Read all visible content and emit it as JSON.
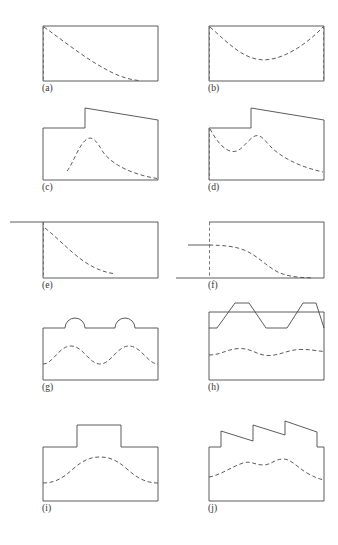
{
  "figure": {
    "panel_count": 10,
    "colors": {
      "outline": "#4a4a4a",
      "dashed": "#4a4a4a",
      "dashed_edge": "#6a6a6a",
      "background": "#ffffff",
      "label": "#333333"
    },
    "panels": [
      {
        "id": "a",
        "label": "(a)",
        "outline_name": "plain-rectangle",
        "interior_curve": "monotonic-decay",
        "left_edge_dashed": true,
        "right_edge_dashed": false
      },
      {
        "id": "b",
        "label": "(b)",
        "outline_name": "plain-rectangle",
        "interior_curve": "u-shaped-catenary",
        "left_edge_dashed": true,
        "right_edge_dashed": true
      },
      {
        "id": "c",
        "label": "(c)",
        "outline_name": "single-raised-step-sloping-roof",
        "interior_curve": "peak-and-decay",
        "left_edge_dashed": false,
        "right_edge_dashed": false
      },
      {
        "id": "d",
        "label": "(d)",
        "outline_name": "single-raised-step-sloping-roof",
        "interior_curve": "dip-peak-decay",
        "left_edge_dashed": true,
        "right_edge_dashed": false
      },
      {
        "id": "e",
        "label": "(e)",
        "outline_name": "rectangle-with-left-extended-top-line",
        "interior_curve": "monotonic-decay-partial",
        "left_edge_dashed": true,
        "right_edge_dashed": false
      },
      {
        "id": "f",
        "label": "(f)",
        "outline_name": "rectangle-with-left-extended-base-and-mid-line",
        "interior_curve": "sigmoid-descent",
        "left_edge_dashed": true,
        "right_edge_dashed": false
      },
      {
        "id": "g",
        "label": "(g)",
        "outline_name": "rectangle-with-two-semicircular-bumps",
        "interior_curve": "two-hump-sinusoid",
        "left_edge_dashed": false,
        "right_edge_dashed": false
      },
      {
        "id": "h",
        "label": "(h)",
        "outline_name": "rectangle-with-two-trapezoidal-crenellations",
        "interior_curve": "gentle-wave",
        "left_edge_dashed": false,
        "right_edge_dashed": false
      },
      {
        "id": "i",
        "label": "(i)",
        "outline_name": "rectangle-with-central-raised-block",
        "interior_curve": "single-broad-hump",
        "left_edge_dashed": false,
        "right_edge_dashed": false
      },
      {
        "id": "j",
        "label": "(j)",
        "outline_name": "rectangle-with-three-tooth-sawtooth-roof",
        "interior_curve": "rising-wavy-then-descending",
        "left_edge_dashed": false,
        "right_edge_dashed": false
      }
    ]
  }
}
